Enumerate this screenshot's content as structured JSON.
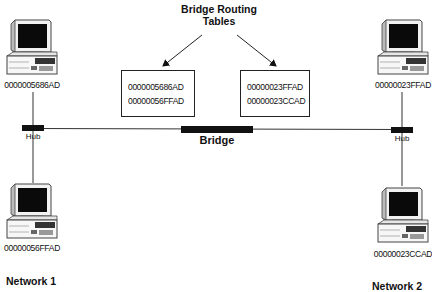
{
  "diagram": {
    "title": "Bridge Routing\nTables",
    "title_lines": [
      "Bridge Routing",
      "Tables"
    ],
    "bridge": {
      "label": "Bridge"
    },
    "networks": [
      {
        "label": "Network 1",
        "hub_label": "Hub",
        "computers": [
          {
            "mac": "0000005686AD",
            "position": "top"
          },
          {
            "mac": "00000056FFAD",
            "position": "bottom"
          }
        ]
      },
      {
        "label": "Network 2",
        "hub_label": "Hub",
        "computers": [
          {
            "mac": "00000023FFAD",
            "position": "top"
          },
          {
            "mac": "00000023CCAD",
            "position": "bottom"
          }
        ]
      }
    ],
    "routing_tables": [
      {
        "side": "left",
        "entries": [
          "0000005686AD",
          "00000056FFAD"
        ]
      },
      {
        "side": "right",
        "entries": [
          "00000023FFAD",
          "00000023CCAD"
        ]
      }
    ],
    "colors": {
      "line": "#333333",
      "device": "#111111",
      "background": "#ffffff"
    }
  }
}
